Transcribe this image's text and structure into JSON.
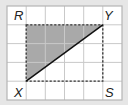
{
  "diagram": {
    "type": "grid-geometry",
    "grid": {
      "columns": 6,
      "rows": 5,
      "x_lines": [
        7,
        26.2,
        45.3,
        64.5,
        83.7,
        102.8,
        122
      ],
      "y_lines": [
        6,
        24.8,
        43.6,
        62.4,
        81.2,
        100
      ],
      "cell_fill": "#ffffff",
      "line_color": "#c9c9c9",
      "border_color": "#b5b5b5"
    },
    "rectangle": {
      "style": "dashed",
      "color": "#333333",
      "corners": [
        "R",
        "Y",
        "S",
        "X"
      ]
    },
    "points": {
      "R": {
        "x": 26.2,
        "y": 24.8,
        "label": "R",
        "lx": 14,
        "ly": 20
      },
      "Y": {
        "x": 102.8,
        "y": 24.8,
        "label": "Y",
        "lx": 104,
        "ly": 20
      },
      "S": {
        "x": 102.8,
        "y": 81.2,
        "label": "S",
        "lx": 105,
        "ly": 97
      },
      "X": {
        "x": 26.2,
        "y": 81.2,
        "label": "X",
        "lx": 14,
        "ly": 97
      }
    },
    "shaded_triangle": {
      "vertices": [
        "R",
        "Y",
        "X"
      ],
      "fill": "#a9a9a9"
    },
    "diagonal": {
      "from": "X",
      "to": "Y",
      "color": "#111111"
    },
    "background": "#e6e6e6"
  }
}
